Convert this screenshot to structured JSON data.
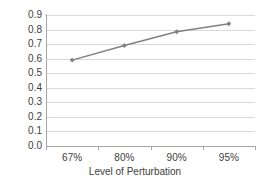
{
  "chart_data": {
    "type": "line",
    "title": "",
    "xlabel": "Level of Perturbation",
    "ylabel": "",
    "categories": [
      "67%",
      "80%",
      "90%",
      "95%"
    ],
    "values": [
      0.59,
      0.69,
      0.785,
      0.84
    ],
    "series": [
      {
        "name": "",
        "values": [
          0.59,
          0.69,
          0.785,
          0.84
        ],
        "color": "#808080",
        "marker": "diamond",
        "line_width": 1.5
      }
    ],
    "ylim": [
      0.0,
      0.9
    ],
    "ytick_labels": [
      "0.9",
      "0.8",
      "0.7",
      "0.6",
      "0.5",
      "0.4",
      "0.3",
      "0.2",
      "0.1",
      "0.0"
    ],
    "ytick_values": [
      0.9,
      0.8,
      0.7,
      0.6,
      0.5,
      0.4,
      0.3,
      0.2,
      0.1,
      0.0
    ],
    "ytick_step": 0.1,
    "grid": "horizontal",
    "grid_color": "#d9d9d9",
    "axis_color": "#a6a6a6",
    "legend": "none",
    "background": "#ffffff"
  }
}
